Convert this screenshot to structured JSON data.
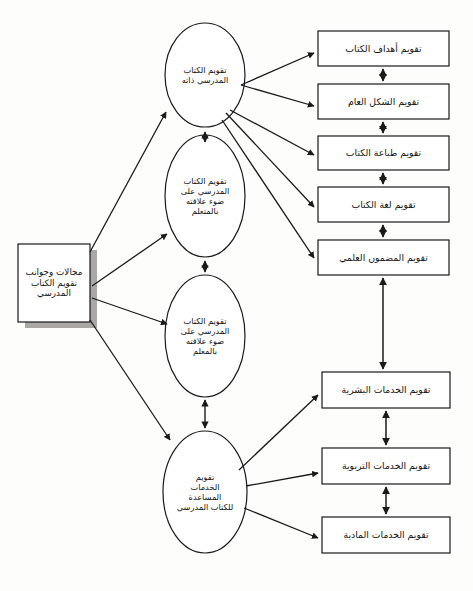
{
  "diagram": {
    "title": "مجالات وجوانب تقويم الكتاب المدرسي",
    "language": "ar",
    "direction": "rtl",
    "colors": {
      "stroke": "#1a1a1a",
      "text": "#141414",
      "background": "#fdfdfc",
      "shadow": "#a9a8a4",
      "node_fill": "#ffffff"
    }
  },
  "source": {
    "label": "مجالات وجوانب\nتقويم الكتاب\nالمدرسي",
    "line1": "مجالات وجوانب",
    "line2": "تقويم الكتاب",
    "line3": "المدرسي"
  },
  "ellipses": [
    {
      "id": "ellipse-book-itself",
      "label": "تقويم الكتاب\nالمدرسي ذاته"
    },
    {
      "id": "ellipse-relation-learner",
      "label": "تقويم الكتاب\nالمدرسي على\nضوء علاقته\nبالمتعلم"
    },
    {
      "id": "ellipse-relation-teacher",
      "label": "تقويم الكتاب\nالمدرسي على\nضوء علاقته\nبالمعلم"
    },
    {
      "id": "ellipse-support-services",
      "label": "تقويم\nالخدمات\nالمساعدة\nللكتاب المدرسي"
    }
  ],
  "top_boxes": [
    {
      "id": "box-objectives",
      "label": "تقويم أهداف الكتاب"
    },
    {
      "id": "box-general-form",
      "label": "تقويم الشكل العام"
    },
    {
      "id": "box-printing",
      "label": "تقويم طباعة الكتاب"
    },
    {
      "id": "box-language",
      "label": "تقويم لغة الكتاب"
    },
    {
      "id": "box-scientific-content",
      "label": "تقويم المضمون العلمي"
    }
  ],
  "bottom_boxes": [
    {
      "id": "box-human-services",
      "label": "تقويم الخدمات البشرية"
    },
    {
      "id": "box-educational-services",
      "label": "تقويم الخدمات التربوية"
    },
    {
      "id": "box-material-services",
      "label": "تقويم الخدمات المادية"
    }
  ]
}
